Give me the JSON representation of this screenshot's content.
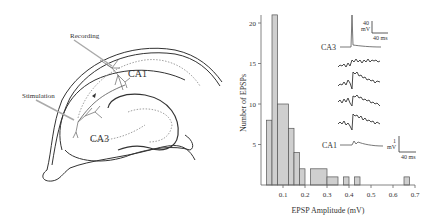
{
  "diagram": {
    "labels": {
      "recording": "Recording",
      "stimulation": "Stimulation",
      "ca1": "CA1",
      "ca3": "CA3"
    }
  },
  "inset": {
    "ca3_label": "CA3",
    "ca1_label": "CA1",
    "ca3_scale": {
      "v": "40",
      "v_unit": "mV",
      "t": "40 ms"
    },
    "ca1_scale": {
      "v": "1",
      "v_unit": "mV",
      "t": "40 ms"
    }
  },
  "chart_data": {
    "type": "bar",
    "title": "",
    "xlabel": "EPSP Amplitude (mV)",
    "ylabel": "Number of EPSPs",
    "xlim": [
      0,
      0.7
    ],
    "ylim": [
      0,
      21
    ],
    "x_ticks": [
      "0.1",
      "0.2",
      "0.3",
      "0.4",
      "0.5",
      "0.6",
      "0.7"
    ],
    "y_ticks": [
      "5",
      "10",
      "15",
      "20"
    ],
    "grid": false,
    "bins": [
      {
        "x0": 0.025,
        "x1": 0.05,
        "count": 8
      },
      {
        "x0": 0.05,
        "x1": 0.075,
        "count": 21
      },
      {
        "x0": 0.075,
        "x1": 0.125,
        "count": 10
      },
      {
        "x0": 0.125,
        "x1": 0.15,
        "count": 7
      },
      {
        "x0": 0.15,
        "x1": 0.175,
        "count": 4
      },
      {
        "x0": 0.175,
        "x1": 0.2,
        "count": 2
      },
      {
        "x0": 0.225,
        "x1": 0.3,
        "count": 2
      },
      {
        "x0": 0.3,
        "x1": 0.35,
        "count": 1
      },
      {
        "x0": 0.375,
        "x1": 0.4,
        "count": 1
      },
      {
        "x0": 0.425,
        "x1": 0.45,
        "count": 1
      },
      {
        "x0": 0.65,
        "x1": 0.675,
        "count": 1
      }
    ],
    "colors": {
      "bar_fill": "#cfcfcf",
      "bar_stroke": "#555555"
    }
  }
}
